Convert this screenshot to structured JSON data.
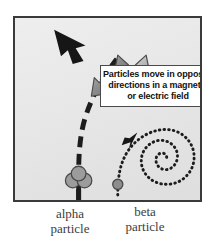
{
  "figure": {
    "background_color": "#e8e8e8",
    "frame_color": "#3a3a3a"
  },
  "callout": {
    "name": "callout-box",
    "lines": [
      "Particles move in opposite",
      "directions in a magnetic",
      "or electric field"
    ],
    "text_color": "#111111",
    "box_color": "#ffffff"
  },
  "labels": {
    "alpha": {
      "line1": "alpha",
      "line2": "particle"
    },
    "beta": {
      "line1": "beta",
      "line2": "particle"
    }
  },
  "particles": {
    "alpha": {
      "name": "alpha-particle",
      "style": "three overlapping filled circles",
      "fill": "#9a9a9a",
      "track": "thick dashed curve bending up and to the left",
      "arrow_direction": "upper-left"
    },
    "beta": {
      "name": "beta-particle",
      "style": "single filled circle",
      "fill": "#8d8d8d",
      "track": "dotted curve spiralling inward to the right",
      "arrow_direction": "upper-right"
    }
  },
  "pointer_arrows": [
    {
      "name": "pointer-arrow-left",
      "direction": "down-left",
      "target": "alpha particle track"
    },
    {
      "name": "pointer-arrow-right",
      "direction": "down-right",
      "target": "beta particle track"
    }
  ]
}
